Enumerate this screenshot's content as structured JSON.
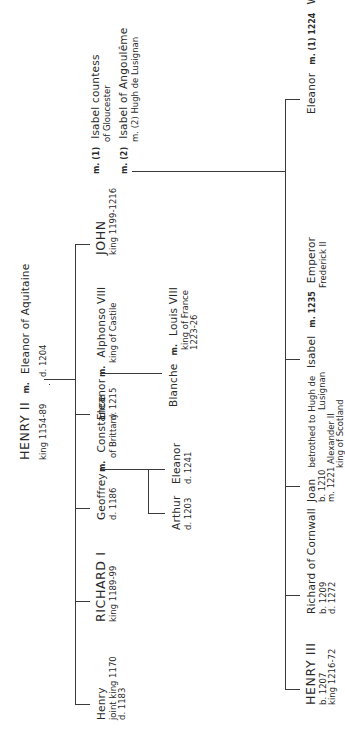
{
  "diagram": {
    "type": "family-tree",
    "orientation": "rotated-90-ccw",
    "root": {
      "name": "HENRY II",
      "detail": "king 1154-89",
      "marriage_marker": "m.",
      "spouse": "Eleanor of Aquitaine",
      "spouse_detail": "d. 1204"
    },
    "children": [
      {
        "name": "Henry",
        "lines": [
          "joint king 1170",
          "d. 1183"
        ]
      },
      {
        "name": "RICHARD I",
        "lines": [
          "king 1189-99"
        ]
      },
      {
        "name": "Geoffrey",
        "lines": [
          "d. 1186"
        ],
        "marriage_marker": "m.",
        "spouse": "Constance",
        "spouse_lines": [
          "of Brittany"
        ],
        "children": [
          {
            "name": "Eleanor",
            "lines": [
              "d. 1241"
            ]
          },
          {
            "name": "Arthur",
            "lines": [
              "d. 1203"
            ]
          }
        ]
      },
      {
        "name": "Eleanor",
        "lines": [
          "d. 1215"
        ],
        "marriage_marker": "m.",
        "spouse": "Alphonso VIII",
        "spouse_lines": [
          "king of Castile"
        ],
        "children": [
          {
            "name": "Blanche",
            "marriage_marker": "m.",
            "spouse": "Louis VIII",
            "spouse_lines": [
              "king of France",
              "1223-26"
            ]
          }
        ]
      },
      {
        "name": "JOHN",
        "lines": [
          "king 1199-1216"
        ],
        "marriages": [
          {
            "marker": "m. (1)",
            "spouse": "Isabel countess",
            "spouse_lines": [
              "of Gloucester"
            ]
          },
          {
            "marker": "m. (2)",
            "spouse": "Isabel of Angoulême",
            "spouse_lines": [
              "m. (2) Hugh de Lusignan"
            ]
          }
        ],
        "children": [
          {
            "name": "HENRY III",
            "lines": [
              "b. 1207",
              "king 1216-72"
            ]
          },
          {
            "name": "Richard of Cornwall",
            "lines": [
              "b. 1209",
              "d. 1272"
            ]
          },
          {
            "name": "Joan",
            "note": "betrothed to Hugh de",
            "note2": "Lusignan",
            "lines": [
              "b. 1210",
              "m. 1221 Alexander II",
              "king of Scotland"
            ]
          },
          {
            "name": "Isabel",
            "marriage_marker": "m. 1235",
            "spouse": "Emperor",
            "spouse_lines": [
              "Frederick II"
            ]
          },
          {
            "name": "Eleanor",
            "marriages": [
              {
                "marker": "m. (1) 1224",
                "spouse": "William Marshal",
                "spouse_lines": [
                  "earl of Pembroke"
                ]
              },
              {
                "marker": "m. (2) 1238",
                "spouse": "Simon de Montfort"
              }
            ]
          }
        ]
      }
    ]
  }
}
